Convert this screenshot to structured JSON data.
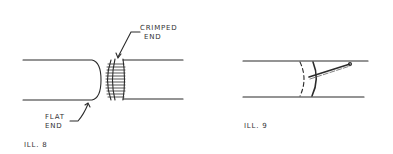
{
  "figures": [
    {
      "id": "ill8",
      "caption": "ILL. 8",
      "labels": {
        "crimped_line1": "CRIMPED",
        "crimped_line2": "END",
        "flat_line1": "FLAT",
        "flat_line2": "END"
      }
    },
    {
      "id": "ill9",
      "caption": "ILL. 9"
    }
  ],
  "colors": {
    "ink": "#2b2b2b",
    "background": "#ffffff"
  }
}
